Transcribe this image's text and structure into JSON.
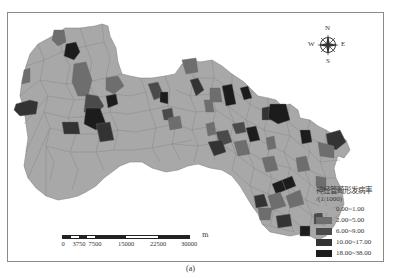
{
  "figure": {
    "caption": "(a)"
  },
  "map": {
    "base_color": "#a8a8a8",
    "edge_color": "#7a7a7a"
  },
  "compass": {
    "n": "N",
    "s": "S",
    "e": "E",
    "w": "W"
  },
  "legend": {
    "title": "神经管畸形发病率",
    "unit": "/(1/1000)",
    "classes": [
      {
        "label": "0.00~1.00",
        "color": "#a8a8a8"
      },
      {
        "label": "2.00~5.00",
        "color": "#6e6e6e"
      },
      {
        "label": "6.00~9.00",
        "color": "#4a4a4a"
      },
      {
        "label": "10.00~17.00",
        "color": "#333333"
      },
      {
        "label": "18.00~38.00",
        "color": "#1c1c1c"
      }
    ]
  },
  "scale_bar": {
    "unit": "m",
    "ticks": [
      "0",
      "3750",
      "7500",
      "15000",
      "22500",
      "30000"
    ]
  }
}
